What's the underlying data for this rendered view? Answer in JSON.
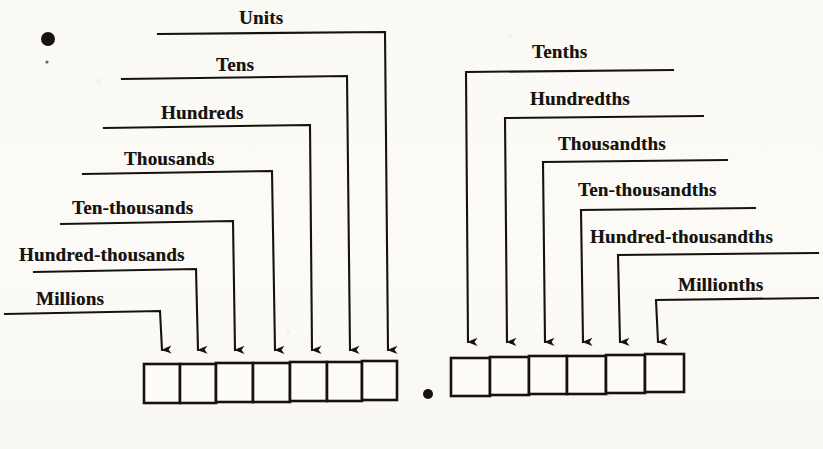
{
  "figure": {
    "kind": "place-value-chart",
    "background_color": "#fbfaf6",
    "ink_color": "#16130f",
    "decimal_point_symbol": "•"
  },
  "integer_side": {
    "box_count": 7,
    "labels": [
      {
        "text": "Millions",
        "place_index": 7
      },
      {
        "text": "Hundred-thousands",
        "place_index": 6
      },
      {
        "text": "Ten-thousands",
        "place_index": 5
      },
      {
        "text": "Thousands",
        "place_index": 4
      },
      {
        "text": "Hundreds",
        "place_index": 3
      },
      {
        "text": "Tens",
        "place_index": 2
      },
      {
        "text": "Units",
        "place_index": 1
      }
    ]
  },
  "decimal_side": {
    "box_count": 6,
    "labels": [
      {
        "text": "Tenths",
        "place_index": 1
      },
      {
        "text": "Hundredths",
        "place_index": 2
      },
      {
        "text": "Thousandths",
        "place_index": 3
      },
      {
        "text": "Ten-thousandths",
        "place_index": 4
      },
      {
        "text": "Hundred-thousandths",
        "place_index": 5
      },
      {
        "text": "Millionths",
        "place_index": 6
      }
    ]
  },
  "marks": {
    "top_left_dot": "•",
    "center_decimal_dot": "•",
    "bottom_left_dot": "•"
  }
}
